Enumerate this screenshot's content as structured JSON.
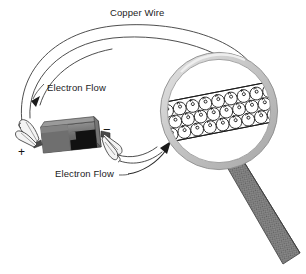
{
  "figure": {
    "background_color": "#ffffff",
    "width": 306,
    "height": 274
  },
  "labels": {
    "copper_wire": "Copper Wire",
    "electron_flow_top": "Electron Flow",
    "electron_flow_bottom": "Electron Flow",
    "terminal_positive": "+",
    "terminal_negative": "−"
  },
  "colors": {
    "stroke": "#1c1c1c",
    "wire_line": "#3a3a3a",
    "battery_body": "#6e6e6e",
    "battery_dark": "#111111",
    "battery_light": "#9a9a9a",
    "clip_fill": "#f2f2f2",
    "lens_rim": "#c9c9c9",
    "lens_rim_edge": "#8d8d8d",
    "lens_glass": "#ffffff",
    "handle_fill": "#8a8a8a",
    "handle_texture": "#5a5a5a",
    "atom_stroke": "#1a1a1a"
  },
  "parts": {
    "wire_loop": "copper-wire-loop",
    "battery": "battery-cell",
    "clip_left": "alligator-clip-positive",
    "clip_right": "alligator-clip-negative",
    "magnifier": "magnifying-glass",
    "magnifier_handle": "magnifying-glass-handle",
    "wire_cutaway": "wire-cross-section",
    "arrow_top": "electron-flow-arrow-left",
    "arrow_bottom": "electron-flow-arrow-to-lens",
    "leader_top": "electron-flow-leader-top",
    "leader_bottom": "electron-flow-leader-bottom"
  },
  "atom_rows": [
    {
      "name": "row-top",
      "count": 12
    },
    {
      "name": "row-middle",
      "count": 12
    },
    {
      "name": "row-bottom",
      "count": 11
    }
  ]
}
